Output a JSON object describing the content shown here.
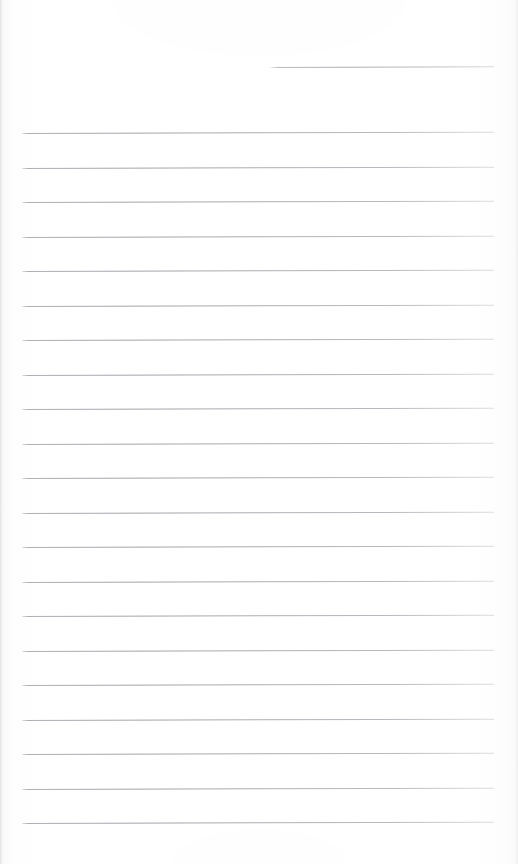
{
  "document": {
    "kind": "scanned-lined-paper",
    "page_width": 518,
    "page_height": 864,
    "paper_color": "#fefefe",
    "rule_color": "#969aa0",
    "content_text": "",
    "is_blank": "true"
  },
  "top_artifact": {
    "note": "clipped illegible text from previous line, cut off by page crop",
    "fragment_left": "",
    "fragment_right": ""
  },
  "rules": {
    "count": 22,
    "spacing_px": 34.5,
    "left_margin_px": 22,
    "right_margin_px": 494,
    "first_full_line_y": 133,
    "last_line_y": 823,
    "partial_line": {
      "y": 67,
      "x_start": 270,
      "x_end": 494,
      "label": "partial-rule"
    },
    "full_lines_y": [
      133,
      167.5,
      202,
      236.5,
      271,
      305.5,
      340,
      374.5,
      409,
      443.5,
      478,
      512.5,
      547,
      581.5,
      616,
      650.5,
      685,
      719.5,
      754,
      788.5,
      823
    ]
  }
}
